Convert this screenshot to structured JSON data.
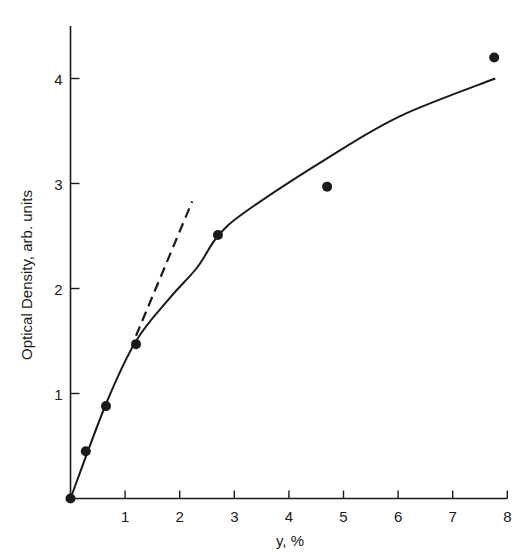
{
  "chart_data": {
    "type": "scatter",
    "title": "",
    "xlabel": "y, %",
    "ylabel": "Optical Density, arb. units",
    "xlim": [
      0,
      8
    ],
    "ylim": [
      0,
      4.5
    ],
    "xticks": [
      1,
      2,
      3,
      4,
      5,
      6,
      7,
      8
    ],
    "yticks": [
      1,
      2,
      3,
      4
    ],
    "grid": false,
    "legend": null,
    "series": [
      {
        "name": "measured",
        "kind": "points",
        "x": [
          0,
          0.28,
          0.65,
          1.2,
          2.7,
          4.7,
          7.76
        ],
        "y": [
          0,
          0.45,
          0.88,
          1.47,
          2.51,
          2.97,
          4.2
        ]
      },
      {
        "name": "fit curve",
        "kind": "solid-line",
        "x": [
          0,
          0.65,
          1.2,
          1.82,
          2.32,
          2.7,
          3.23,
          4.7,
          6.03,
          7.78
        ],
        "y": [
          0,
          0.9,
          1.5,
          1.91,
          2.2,
          2.5,
          2.74,
          3.24,
          3.64,
          4.0
        ]
      },
      {
        "name": "initial slope",
        "kind": "dashed-line",
        "x": [
          1.2,
          2.23
        ],
        "y": [
          1.55,
          2.83
        ]
      }
    ]
  },
  "colors": {
    "ink": "#1a1a1a",
    "background": "#ffffff"
  }
}
